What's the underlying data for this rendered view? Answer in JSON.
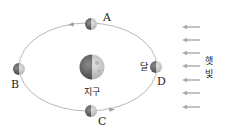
{
  "diagram": {
    "type": "moon-orbit-phases",
    "earth": {
      "label": "지구"
    },
    "moon": {
      "label": "달"
    },
    "positions": [
      {
        "id": "A",
        "label": "A"
      },
      {
        "id": "B",
        "label": "B"
      },
      {
        "id": "C",
        "label": "C"
      },
      {
        "id": "D",
        "label": "D"
      }
    ],
    "sunlight": {
      "label_line1": "햇",
      "label_line2": "빛",
      "direction": "right-to-left",
      "arrow_count": 7
    },
    "orbit_direction": "counterclockwise",
    "colors": {
      "orbit": "#b8b8b8",
      "arrow": "#a8a8a8",
      "dark_side": "#555555",
      "lit_side": "#c8c8c8",
      "text": "#222222"
    }
  }
}
